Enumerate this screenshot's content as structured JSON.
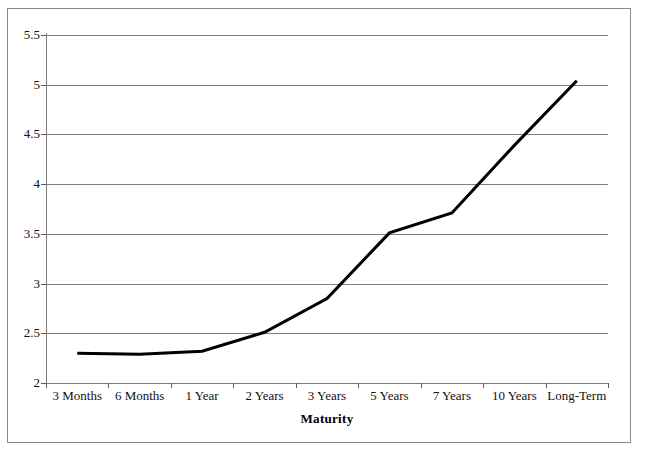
{
  "chart_data": {
    "type": "line",
    "title": "",
    "xlabel": "Maturity",
    "ylabel": "",
    "categories": [
      "3 Months",
      "6 Months",
      "1 Year",
      "2 Years",
      "3 Years",
      "5 Years",
      "7 Years",
      "10 Years",
      "Long-Term"
    ],
    "values": [
      2.3,
      2.29,
      2.32,
      2.51,
      2.85,
      3.51,
      3.71,
      4.39,
      5.04
    ],
    "series": [
      {
        "name": "Yield",
        "values": [
          2.3,
          2.29,
          2.32,
          2.51,
          2.85,
          3.51,
          3.71,
          4.39,
          5.04
        ]
      }
    ],
    "ylim": [
      2,
      5.5
    ],
    "yticks": [
      2,
      2.5,
      3,
      3.5,
      4,
      4.5,
      5,
      5.5
    ],
    "ytick_labels": [
      "2",
      "2.5",
      "3",
      "3.5",
      "4",
      "4.5",
      "5",
      "5.5"
    ],
    "grid": "horizontal",
    "legend": "none",
    "line_color": "#000000",
    "line_width": 3,
    "markers": false,
    "frame_color": "#8a8a8a",
    "gridline_color": "#808080",
    "background": "#ffffff"
  }
}
